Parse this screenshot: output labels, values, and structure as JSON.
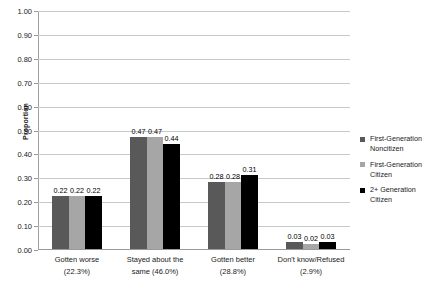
{
  "chart_data": {
    "type": "bar",
    "title": "",
    "subtitle": "",
    "xlabel": "",
    "ylabel": "Proportion",
    "ylim": [
      0,
      1.0
    ],
    "ytick_step": 0.1,
    "ytick_labels": [
      "1.00",
      "0.90",
      "0.80",
      "0.70",
      "0.60",
      "0.50",
      "0.40",
      "0.30",
      "0.20",
      "0.10",
      "0.00"
    ],
    "ytick_values": [
      1.0,
      0.9,
      0.8,
      0.7,
      0.6,
      0.5,
      0.4,
      0.3,
      0.2,
      0.1,
      0.0
    ],
    "grid": true,
    "legend_position": "right",
    "categories": [
      "Gotten worse (22.3%)",
      "Stayed about the same (46.0%)",
      "Gotten better (28.8%)",
      "Don't know/Refused (2.9%)"
    ],
    "category_lines": [
      [
        "Gotten worse",
        "(22.3%)"
      ],
      [
        "Stayed about the",
        "same (46.0%)"
      ],
      [
        "Gotten better",
        "(28.8%)"
      ],
      [
        "Don't know/Refused",
        "(2.9%)"
      ]
    ],
    "series": [
      {
        "name": "First-Generation Noncitizen",
        "name_lines": [
          "First-Generation",
          "Noncitizen"
        ],
        "color": "#595959",
        "values": [
          0.22,
          0.47,
          0.28,
          0.03
        ],
        "labels": [
          "0.22",
          "0.47",
          "0.28",
          "0.03"
        ]
      },
      {
        "name": "First-Generation Citizen",
        "name_lines": [
          "First-Generation",
          "Citizen"
        ],
        "color": "#a6a6a6",
        "values": [
          0.22,
          0.47,
          0.28,
          0.02
        ],
        "labels": [
          "0.22",
          "0.47",
          "0.28",
          "0.02"
        ]
      },
      {
        "name": "2+ Generation Citizen",
        "name_lines": [
          "2+ Generation",
          "Citizen"
        ],
        "color": "#000000",
        "values": [
          0.22,
          0.44,
          0.31,
          0.03
        ],
        "labels": [
          "0.22",
          "0.44",
          "0.31",
          "0.03"
        ]
      }
    ]
  }
}
